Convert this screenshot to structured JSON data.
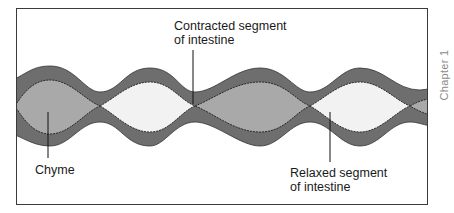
{
  "figure": {
    "side_tab": "Chapter 1",
    "labels": {
      "contracted": {
        "line1": "Contracted segment",
        "line2": "of intestine"
      },
      "chyme": "Chyme",
      "relaxed": {
        "line1": "Relaxed segment",
        "line2": "of intestine"
      }
    },
    "colors": {
      "wall": "#6e6e6e",
      "chyme": "#a9a9a9",
      "lumen_empty": "#f2f2f2",
      "outline": "#222222",
      "frame": "#3a3a3a"
    }
  }
}
